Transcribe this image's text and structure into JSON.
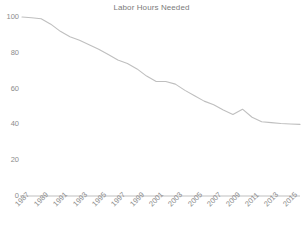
{
  "chart_data": {
    "type": "line",
    "title": "Labor Hours Needed",
    "xlabel": "",
    "ylabel": "",
    "ylim": [
      0,
      100
    ],
    "yticks": [
      0,
      20,
      40,
      60,
      80,
      100
    ],
    "grid": false,
    "legend": "none",
    "line_color": "#bfbfbf",
    "axis_color": "#d0d0d0",
    "text_color": "#8c8c8c",
    "xtick_rotation": -45,
    "xtick_labels": [
      "1987",
      "1989",
      "1991",
      "1993",
      "1995",
      "1997",
      "1999",
      "2001",
      "2003",
      "2005",
      "2007",
      "2009",
      "2011",
      "2013",
      "2015"
    ],
    "x": [
      1987,
      1988,
      1989,
      1990,
      1991,
      1992,
      1993,
      1994,
      1995,
      1996,
      1997,
      1998,
      1999,
      2000,
      2001,
      2002,
      2003,
      2004,
      2005,
      2006,
      2007,
      2008,
      2009,
      2010,
      2011,
      2012,
      2013,
      2014,
      2015,
      2016
    ],
    "values": [
      100,
      99.6,
      99,
      96,
      92,
      89,
      87,
      84.5,
      82,
      79,
      76,
      74,
      71,
      67,
      64,
      64,
      62.5,
      59,
      56,
      53,
      51,
      48,
      45.5,
      48.5,
      44,
      41.5,
      41,
      40.5,
      40.2,
      40
    ]
  }
}
